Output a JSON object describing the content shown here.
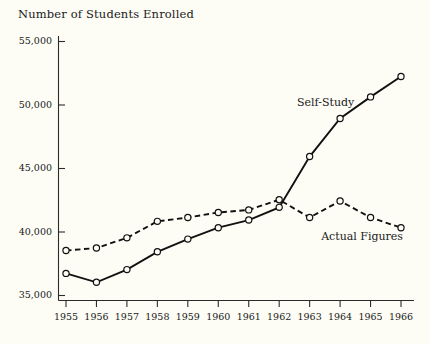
{
  "chart_data": {
    "type": "line",
    "title": "Number of Students Enrolled",
    "xlabel": "",
    "ylabel": "",
    "grid": false,
    "legend_position": "inline-annotation",
    "categories": [
      "1955",
      "1956",
      "1957",
      "1958",
      "1959",
      "1960",
      "1961",
      "1962",
      "1963",
      "1964",
      "1965",
      "1966"
    ],
    "x": [
      1955,
      1956,
      1957,
      1958,
      1959,
      1960,
      1961,
      1962,
      1963,
      1964,
      1965,
      1966
    ],
    "xlim": [
      1955,
      1966
    ],
    "ylim": [
      35000,
      55000
    ],
    "yticks": [
      35000,
      40000,
      45000,
      50000,
      55000
    ],
    "ytick_labels": [
      "35,000",
      "40,000",
      "45,000",
      "50,000",
      "55,000"
    ],
    "series": [
      {
        "name": "Self-Study",
        "style": "solid",
        "marker": "open-circle",
        "values": [
          36700,
          36000,
          37000,
          38400,
          39400,
          40300,
          40900,
          41900,
          45900,
          48900,
          50600,
          52200
        ]
      },
      {
        "name": "Actual Figures",
        "style": "dashed",
        "marker": "open-circle",
        "values": [
          38500,
          38700,
          39500,
          40800,
          41100,
          41500,
          41700,
          42500,
          41100,
          42400,
          41100,
          40300
        ]
      }
    ],
    "annotations": [
      {
        "text": "Self-Study",
        "series": "Self-Study"
      },
      {
        "text": "Actual Figures",
        "series": "Actual Figures"
      }
    ]
  },
  "colors": {
    "background": "#fdfdf6",
    "ink": "#1a1a1a",
    "axis": "#2b2b2b",
    "line": "#111111"
  }
}
